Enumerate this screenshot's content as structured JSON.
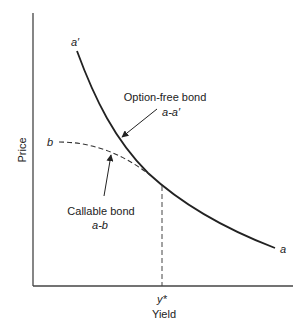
{
  "diagram": {
    "type": "price-yield",
    "axes": {
      "x_label": "Yield",
      "y_label": "Price",
      "x_tick_label": "y*"
    },
    "curves": {
      "option_free": {
        "label": "Option-free bond",
        "sublabel": "a-a′",
        "start_label": "a′",
        "end_label": "a",
        "style": "solid"
      },
      "callable": {
        "label": "Callable bond",
        "sublabel": "a-b",
        "start_label": "b",
        "style": "dashed"
      }
    },
    "colors": {
      "line": "#222222",
      "axis": "#444444",
      "background": "#ffffff"
    }
  }
}
